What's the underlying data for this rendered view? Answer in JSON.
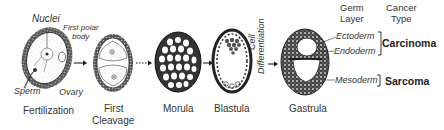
{
  "diagram": {
    "stages": [
      {
        "id": "fertilization",
        "label": "Fertilization"
      },
      {
        "id": "first-cleavage",
        "label_line1": "First",
        "label_line2": "Cleavage"
      },
      {
        "id": "morula",
        "label": "Morula"
      },
      {
        "id": "blastula",
        "label": "Blastula"
      },
      {
        "id": "gastrula",
        "label": "Gastrula"
      }
    ],
    "fertilization_labels": {
      "nuclei": "Nuclei",
      "first_polar_body_line1": "First polar",
      "first_polar_body_line2": "body",
      "sperm": "Sperm",
      "ovary": "Ovary"
    },
    "transition": {
      "cell_line1": "Cell",
      "cell_line2": "Differentiation"
    },
    "headers": {
      "germ_line1": "Germ",
      "germ_line2": "Layer",
      "cancer_line1": "Cancer",
      "cancer_line2": "Type"
    },
    "germ_layers": [
      {
        "name": "Ectoderm"
      },
      {
        "name": "Endoderm"
      },
      {
        "name": "Mesoderm"
      }
    ],
    "cancer_types": [
      {
        "name": "Carcinoma",
        "layers": [
          "Ectoderm",
          "Endoderm"
        ]
      },
      {
        "name": "Sarcoma",
        "layers": [
          "Mesoderm"
        ]
      }
    ]
  }
}
